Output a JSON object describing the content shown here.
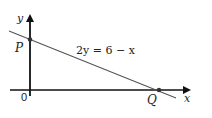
{
  "diagram": {
    "axes": {
      "x_label": "x",
      "y_label": "y",
      "origin_label": "0"
    },
    "line": {
      "equation_label": "2y = 6 − x",
      "color": "#555555"
    },
    "points": [
      {
        "name": "P",
        "description": "y-intercept"
      },
      {
        "name": "Q",
        "description": "x-intercept"
      }
    ],
    "colors": {
      "axis": "#111111",
      "line": "#555555",
      "point": "#333333",
      "text": "#222222"
    }
  }
}
